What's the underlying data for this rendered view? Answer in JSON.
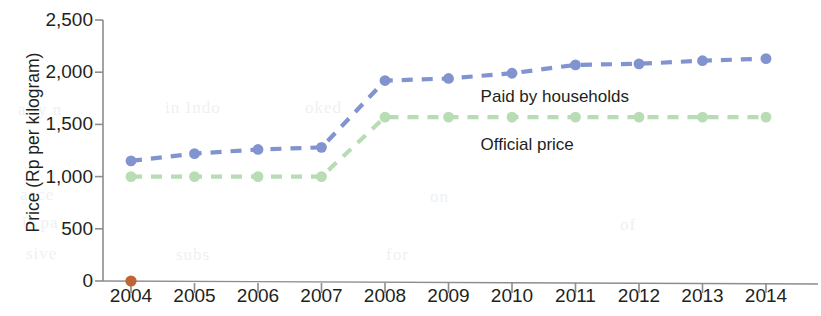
{
  "chart_data": {
    "type": "line",
    "title": "",
    "xlabel": "",
    "ylabel": "Price (Rp per kilogram)",
    "categories": [
      "2004",
      "2005",
      "2006",
      "2007",
      "2008",
      "2009",
      "2010",
      "2011",
      "2012",
      "2013",
      "2014"
    ],
    "x": [
      2004,
      2005,
      2006,
      2007,
      2008,
      2009,
      2010,
      2011,
      2012,
      2013,
      2014
    ],
    "ylim": [
      0,
      2500
    ],
    "yticks": [
      0,
      500,
      1000,
      1500,
      2000,
      2500
    ],
    "ytick_labels": [
      "0",
      "500",
      "1,000",
      "1,500",
      "2,000",
      "2,500"
    ],
    "grid": false,
    "legend_position": "inline-annotation",
    "line_style": "dashed",
    "series": [
      {
        "name": "Paid by households",
        "color": "#8294cf",
        "values": [
          1150,
          1220,
          1260,
          1280,
          1920,
          1940,
          1990,
          2070,
          2080,
          2110,
          2130
        ]
      },
      {
        "name": "Official price",
        "color": "#b8dcb4",
        "values": [
          1000,
          1000,
          1000,
          1000,
          1570,
          1570,
          1570,
          1570,
          1570,
          1570,
          1570
        ]
      }
    ],
    "annotations": [
      {
        "text": "Paid by households",
        "x": 2009.6,
        "y": 1760
      },
      {
        "text": "Official price",
        "x": 2009.6,
        "y": 1300
      }
    ],
    "extra_markers": [
      {
        "name": "origin-marker",
        "x": 2004,
        "y": 0,
        "color": "#bd6533"
      }
    ]
  },
  "bleed_text": [
    "ally n",
    "in Indo",
    "oked",
    "acce",
    "is pa",
    "sive",
    "subs",
    "for",
    "on",
    "of"
  ]
}
